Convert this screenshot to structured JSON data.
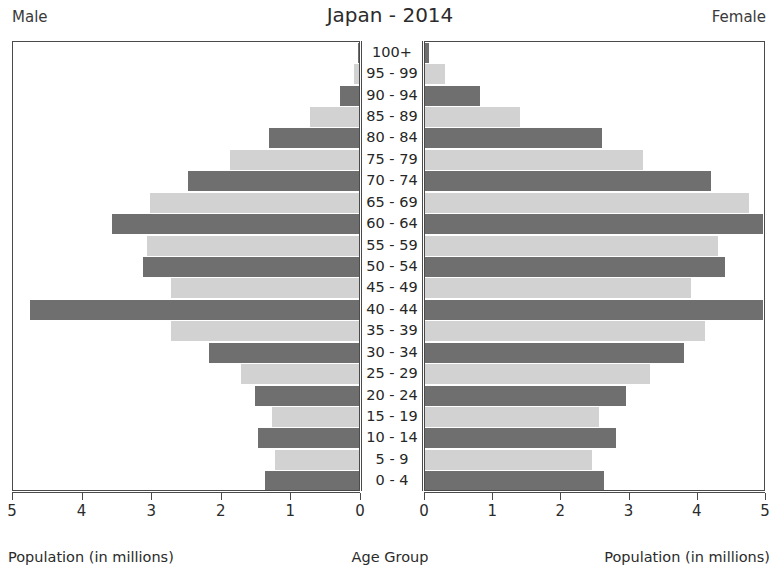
{
  "header": {
    "left_label": "Male",
    "title": "Japan - 2014",
    "right_label": "Female"
  },
  "captions": {
    "left": "Population (in millions)",
    "center": "Age Group",
    "right": "Population (in millions)"
  },
  "axes": {
    "left_ticks": [
      "5",
      "4",
      "3",
      "2",
      "1",
      "0"
    ],
    "right_ticks": [
      "0",
      "1",
      "2",
      "3",
      "4",
      "5"
    ],
    "left_tick_values": [
      5,
      4,
      3,
      2,
      1,
      0
    ],
    "right_tick_values": [
      0,
      1,
      2,
      3,
      4,
      5
    ],
    "max": 5
  },
  "colors": {
    "bar_dark": "#6f6f6f",
    "bar_light": "#d2d2d2",
    "axis": "#4a4a4a",
    "text": "#262626",
    "background": "#ffffff"
  },
  "chart_data": {
    "type": "bar",
    "subtype": "population-pyramid",
    "title": "Japan - 2014",
    "xlabel": "Population (in millions)",
    "ylabel": "Age Group",
    "xlim": [
      0,
      5
    ],
    "grid": false,
    "legend": "none",
    "left_series_name": "Male",
    "right_series_name": "Female",
    "categories": [
      "100+",
      "95 - 99",
      "90 - 94",
      "85 - 89",
      "80 - 84",
      "75 - 79",
      "70 - 74",
      "65 - 69",
      "60 - 64",
      "55 - 59",
      "50 - 54",
      "45 - 49",
      "40 - 44",
      "35 - 39",
      "30 - 34",
      "25 - 29",
      "20 - 24",
      "15 - 19",
      "10 - 14",
      "5 - 9",
      "0 - 4"
    ],
    "series": [
      {
        "name": "Male",
        "side": "left",
        "shade": "alternating",
        "values": [
          0.01,
          0.07,
          0.27,
          0.7,
          1.3,
          1.85,
          2.45,
          3.0,
          3.55,
          3.05,
          3.1,
          2.7,
          4.73,
          2.7,
          2.15,
          1.7,
          1.5,
          1.25,
          1.45,
          1.2,
          1.35
        ]
      },
      {
        "name": "Female",
        "side": "right",
        "shade": "alternating",
        "values": [
          0.06,
          0.3,
          0.8,
          1.4,
          2.6,
          3.2,
          4.2,
          4.75,
          4.95,
          4.3,
          4.4,
          3.9,
          4.96,
          4.1,
          3.8,
          3.3,
          2.95,
          2.55,
          2.8,
          2.45,
          2.62
        ]
      }
    ]
  }
}
